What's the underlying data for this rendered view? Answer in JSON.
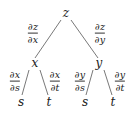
{
  "tree": {
    "root": {
      "label": "z"
    },
    "level1": [
      {
        "label": "x",
        "edge_label": {
          "num": "∂z",
          "den": "∂x"
        }
      },
      {
        "label": "y",
        "edge_label": {
          "num": "∂z",
          "den": "∂y"
        }
      }
    ],
    "level2": [
      {
        "parent": "x",
        "label": "s",
        "edge_label": {
          "num": "∂x",
          "den": "∂s"
        }
      },
      {
        "parent": "x",
        "label": "t",
        "edge_label": {
          "num": "∂x",
          "den": "∂t"
        }
      },
      {
        "parent": "y",
        "label": "s",
        "edge_label": {
          "num": "∂y",
          "den": "∂s"
        }
      },
      {
        "parent": "y",
        "label": "t",
        "edge_label": {
          "num": "∂y",
          "den": "∂t"
        }
      }
    ]
  }
}
